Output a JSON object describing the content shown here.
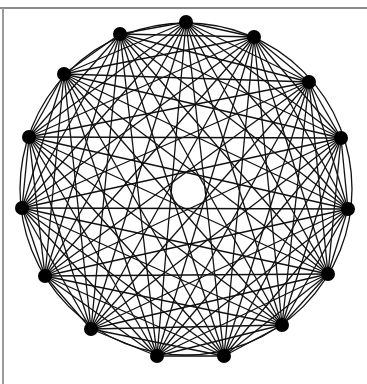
{
  "diagram": {
    "type": "complete-graph",
    "name": "K15",
    "node_count": 15,
    "center": [
      186,
      189
    ],
    "radius": 166,
    "start_angle_deg": -90,
    "node_radius": 7,
    "edge_color": "#111111",
    "node_color": "#000000",
    "edge_width": 1.3,
    "nodes": [
      [
        186,
        22
      ],
      [
        254,
        37
      ],
      [
        309,
        82
      ],
      [
        341,
        138
      ],
      [
        348,
        209
      ],
      [
        328,
        274
      ],
      [
        282,
        325
      ],
      [
        224,
        356
      ],
      [
        157,
        356
      ],
      [
        91,
        329
      ],
      [
        45,
        276
      ],
      [
        22,
        208
      ],
      [
        29,
        137
      ],
      [
        64,
        74
      ],
      [
        120,
        34
      ]
    ]
  }
}
